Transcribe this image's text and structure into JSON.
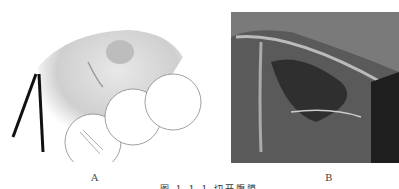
{
  "figure": {
    "panels": [
      {
        "id": "A",
        "label": "A",
        "description": "line illustration of laparoscopic instruments at peritoneum"
      },
      {
        "id": "B",
        "label": "B",
        "description": "grayscale laparoscopic photograph"
      }
    ],
    "caption": "图 1-1-1 切开腹膜"
  }
}
